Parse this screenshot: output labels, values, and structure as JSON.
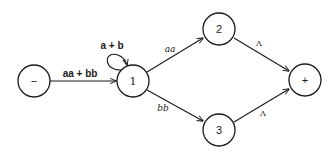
{
  "diagram": {
    "type": "transition-graph",
    "nodes": [
      {
        "id": "start",
        "label": "−",
        "x": 34,
        "y": 81
      },
      {
        "id": "1",
        "label": "1",
        "x": 133,
        "y": 81
      },
      {
        "id": "2",
        "label": "2",
        "x": 219,
        "y": 29
      },
      {
        "id": "3",
        "label": "3",
        "x": 219,
        "y": 130
      },
      {
        "id": "final",
        "label": "+",
        "x": 305,
        "y": 80
      }
    ],
    "edges": [
      {
        "from": "start",
        "to": "1",
        "label": "aa + bb"
      },
      {
        "from": "1",
        "to": "1",
        "label": "a + b"
      },
      {
        "from": "1",
        "to": "2",
        "label": "aa"
      },
      {
        "from": "1",
        "to": "3",
        "label": "bb"
      },
      {
        "from": "2",
        "to": "final",
        "label": "Λ"
      },
      {
        "from": "3",
        "to": "final",
        "label": "Λ"
      }
    ],
    "colors": {
      "stroke": "#1a1a1a",
      "background": "#ffffff"
    }
  }
}
